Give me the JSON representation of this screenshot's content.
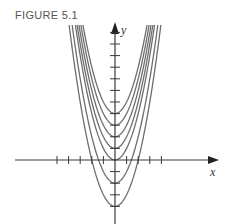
{
  "figure": {
    "label": "FIGURE 5.1"
  },
  "chart_data": {
    "type": "line",
    "title": "FIGURE 5.1",
    "xlabel": "x",
    "ylabel": "y",
    "origin_px": [
      115,
      160
    ],
    "unit_px": 11.6,
    "x_ticks": [
      -5,
      -4,
      -3,
      -2,
      -1,
      1,
      2,
      3,
      4
    ],
    "y_ticks": [
      -4,
      -3,
      -2,
      -1,
      1,
      2,
      3,
      4,
      5,
      6,
      7,
      8,
      9,
      10,
      11
    ],
    "series": [
      {
        "name": "C = 4",
        "C": 4
      },
      {
        "name": "C = 3",
        "C": 3
      },
      {
        "name": "C = 2",
        "C": 2
      },
      {
        "name": "C = 1",
        "C": 1
      },
      {
        "name": "C = 0",
        "C": 0
      },
      {
        "name": "C = -2",
        "C": -2
      },
      {
        "name": "C = -4",
        "C": -4
      }
    ],
    "ylim_px": [
      22,
      224
    ],
    "xlim_px": [
      15,
      218
    ],
    "grid": false,
    "colors": {
      "curve": "#6e6e6e",
      "axis": "#3a3a3a"
    }
  }
}
